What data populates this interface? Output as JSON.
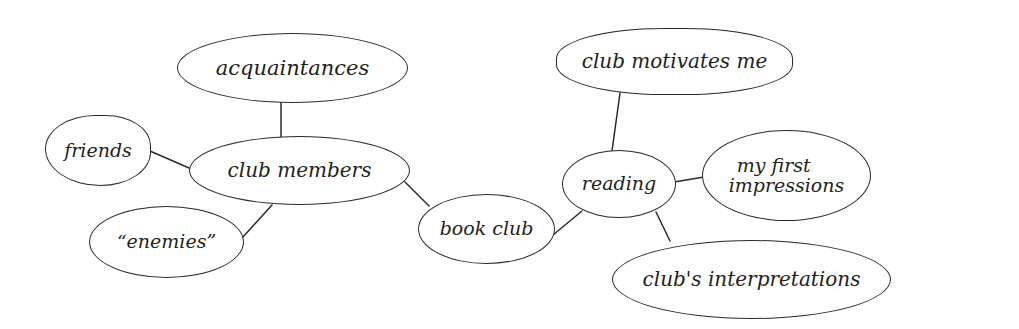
{
  "diagram": {
    "type": "mind-map",
    "style": "hand-drawn",
    "colors": {
      "ink": "#2a2a2a",
      "background": "#ffffff"
    },
    "central": "book club",
    "nodes": {
      "book_club": "book club",
      "club_members": "club members",
      "acquaintances": "acquaintances",
      "friends": "friends",
      "enemies": "“enemies”",
      "reading": "reading",
      "club_motivates_me": "club motivates me",
      "my_first_impressions_line1": "my first",
      "my_first_impressions_line2": "impressions",
      "clubs_interpretations": "club's interpretations"
    },
    "edges": [
      [
        "book club",
        "club members"
      ],
      [
        "club members",
        "acquaintances"
      ],
      [
        "club members",
        "friends"
      ],
      [
        "club members",
        "“enemies”"
      ],
      [
        "book club",
        "reading"
      ],
      [
        "reading",
        "club motivates me"
      ],
      [
        "reading",
        "my first impressions"
      ],
      [
        "reading",
        "club's interpretations"
      ]
    ]
  }
}
